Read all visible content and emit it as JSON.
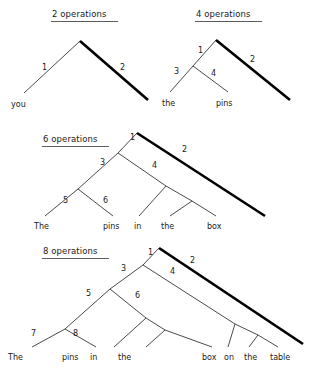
{
  "figure": {
    "background_color": "#ffffff",
    "ink_color": "#1a1a1a",
    "thick_edge_color": "#000000"
  },
  "trees": [
    {
      "id": "tree-2-operations",
      "heading": "2 operations",
      "edge_labels": [
        "1",
        "2"
      ],
      "words": [
        "you"
      ]
    },
    {
      "id": "tree-4-operations",
      "heading": "4 operations",
      "edge_labels": [
        "1",
        "2",
        "3",
        "4"
      ],
      "words": [
        "the",
        "pins"
      ]
    },
    {
      "id": "tree-6-operations",
      "heading": "6 operations",
      "edge_labels": [
        "1",
        "2",
        "3",
        "4",
        "5",
        "6"
      ],
      "words": [
        "The",
        "pins",
        "in",
        "the",
        "box"
      ]
    },
    {
      "id": "tree-8-operations",
      "heading": "8 operations",
      "edge_labels": [
        "1",
        "2",
        "3",
        "4",
        "5",
        "6",
        "7",
        "8"
      ],
      "words": [
        "The",
        "pins",
        "in",
        "the",
        "box",
        "on",
        "the",
        "table"
      ]
    }
  ],
  "labels": {
    "h1": "2 operations",
    "h2": "4 operations",
    "h3": "6 operations",
    "h4": "8 operations",
    "t1_e1": "1",
    "t1_e2": "2",
    "t1_w1": "you",
    "t2_e1": "1",
    "t2_e2": "2",
    "t2_e3": "3",
    "t2_e4": "4",
    "t2_w1": "the",
    "t2_w2": "pins",
    "t3_e1": "1",
    "t3_e2": "2",
    "t3_e3": "3",
    "t3_e4": "4",
    "t3_e5": "5",
    "t3_e6": "6",
    "t3_w1": "The",
    "t3_w2": "pins",
    "t3_w3": "in",
    "t3_w4": "the",
    "t3_w5": "box",
    "t4_e1": "1",
    "t4_e2": "2",
    "t4_e3": "3",
    "t4_e4": "4",
    "t4_e5": "5",
    "t4_e6": "6",
    "t4_e7": "7",
    "t4_e8": "8",
    "t4_w1": "The",
    "t4_w2": "pins",
    "t4_w3": "in",
    "t4_w4": "the",
    "t4_w5": "box",
    "t4_w6": "on",
    "t4_w7": "the",
    "t4_w8": "table"
  }
}
